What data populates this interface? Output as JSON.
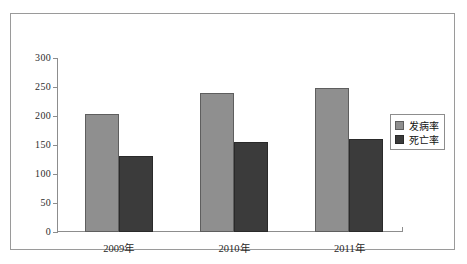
{
  "chart_data": {
    "type": "bar",
    "title": "",
    "xlabel": "",
    "ylabel": "",
    "categories": [
      "2009年",
      "2010年",
      "2011年"
    ],
    "series": [
      {
        "name": "发病率",
        "values": [
          203,
          240,
          248
        ],
        "color": "#8f8f8f"
      },
      {
        "name": "死亡率",
        "values": [
          131,
          155,
          160
        ],
        "color": "#3b3b3b"
      }
    ],
    "ylim": [
      0,
      300
    ],
    "yticks": [
      0,
      50,
      100,
      150,
      200,
      250,
      300
    ],
    "ytick_labels": [
      "0",
      "50",
      "100",
      "150",
      "200",
      "250",
      "300"
    ],
    "grid": false,
    "legend_position": "right"
  },
  "legend": {
    "items": [
      {
        "label": "发病率"
      },
      {
        "label": "死亡率"
      }
    ]
  }
}
